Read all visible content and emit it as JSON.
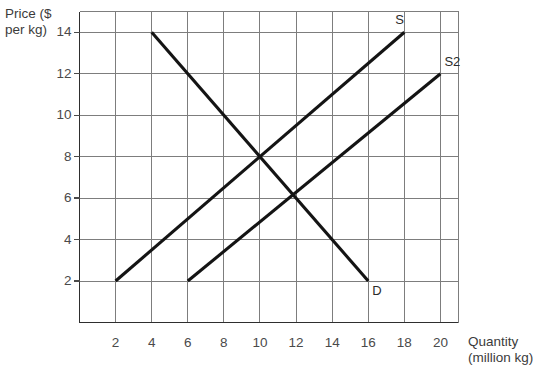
{
  "chart_data": {
    "type": "line",
    "title": "",
    "xlabel": "Quantity (million kg)",
    "ylabel": "Price ($ per kg)",
    "xlim": [
      0,
      21
    ],
    "ylim": [
      0,
      15
    ],
    "grid": true,
    "legend_position": "inline-end-labels",
    "x_ticks": [
      2,
      4,
      6,
      8,
      10,
      12,
      14,
      16,
      18,
      20
    ],
    "y_ticks": [
      2,
      4,
      6,
      8,
      10,
      12,
      14
    ],
    "x_tick_labels": [
      "2",
      "4",
      "6",
      "8",
      "10",
      "12",
      "14",
      "16",
      "18",
      "20"
    ],
    "y_tick_labels": [
      "2",
      "4",
      "6",
      "8",
      "10",
      "12",
      "14"
    ],
    "series": [
      {
        "name": "D",
        "label": "D",
        "kind": "demand",
        "color": "#141414",
        "points": [
          [
            4,
            14
          ],
          [
            16,
            2
          ]
        ],
        "label_point": [
          16,
          2
        ]
      },
      {
        "name": "S",
        "label": "S",
        "kind": "supply",
        "color": "#141414",
        "points": [
          [
            2,
            2
          ],
          [
            18,
            14
          ]
        ],
        "label_point": [
          18,
          14
        ]
      },
      {
        "name": "S2",
        "label": "S2",
        "kind": "supply-shifted",
        "color": "#141414",
        "points": [
          [
            6,
            2
          ],
          [
            20,
            12
          ]
        ],
        "label_point": [
          20,
          12
        ]
      }
    ],
    "annotations": [
      {
        "name": "equilibrium-D-S",
        "x": 10,
        "y": 8
      },
      {
        "name": "equilibrium-D-S2",
        "x": 12,
        "y": 6
      }
    ]
  },
  "axes": {
    "y_title_line1": "Price ($",
    "y_title_line2": "per kg)",
    "x_title_line1": "Quantity",
    "x_title_line2": "(million kg)"
  },
  "labels": {
    "supply": "S",
    "supply_shifted": "S2",
    "demand": "D"
  },
  "colors": {
    "curve": "#141414",
    "grid": "#7d7d7d",
    "axis": "#2e2e2e",
    "text": "#3b3b3b",
    "background": "#ffffff"
  }
}
